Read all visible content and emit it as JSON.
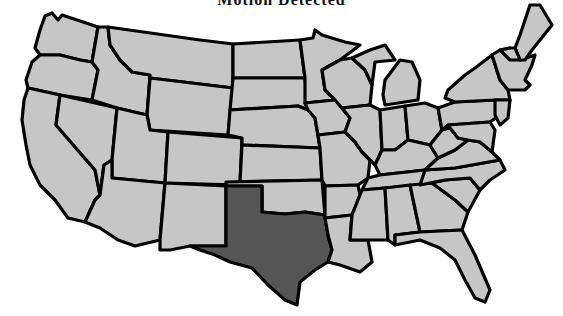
{
  "title": "Motion Detected",
  "map": {
    "fill_color": "#c6c6c6",
    "highlight_color": "#555555",
    "border_color": "#000000",
    "highlighted_state": "Texas",
    "states": [
      {
        "id": "WA",
        "points": "45,16 52,13 58,20 62,15 98,27 92,62 80,60 60,55 40,55 35,48 40,30"
      },
      {
        "id": "OR",
        "points": "40,55 60,55 80,60 92,62 98,70 92,100 60,95 28,88 26,80 32,62"
      },
      {
        "id": "CA",
        "points": "28,88 60,95 56,125 95,170 100,195 95,200 85,222 68,218 55,200 40,185 30,165 26,145 22,120 24,100"
      },
      {
        "id": "NV",
        "points": "60,95 117,108 112,160 104,165 100,195 95,170 56,125"
      },
      {
        "id": "ID",
        "points": "98,27 108,27 110,45 120,60 132,72 150,75 147,115 117,108 92,100 98,70 92,62"
      },
      {
        "id": "MT",
        "points": "108,27 200,40 233,44 233,88 150,78 150,75 132,72 120,60 110,45"
      },
      {
        "id": "WY",
        "points": "150,78 233,88 228,135 150,130 147,115"
      },
      {
        "id": "UT",
        "points": "117,108 147,115 150,130 168,132 165,183 112,178 112,160"
      },
      {
        "id": "AZ",
        "points": "112,178 165,183 160,240 135,246 118,240 100,228 85,222 95,200 100,195 104,165 112,160"
      },
      {
        "id": "CO",
        "points": "168,132 242,138 240,185 165,183"
      },
      {
        "id": "NM",
        "points": "165,183 226,186 226,246 190,246 170,250 160,250 160,240"
      },
      {
        "id": "ND",
        "points": "233,44 300,40 305,78 233,78"
      },
      {
        "id": "SD",
        "points": "233,78 305,78 308,110 298,106 230,110"
      },
      {
        "id": "NE",
        "points": "230,110 298,106 308,110 315,118 320,148 242,145 242,138 228,135"
      },
      {
        "id": "KS",
        "points": "242,145 320,148 322,180 240,182"
      },
      {
        "id": "OK",
        "points": "226,182 322,180 325,215 305,212 285,214 262,212 262,186 226,186"
      },
      {
        "id": "TX",
        "cls": "highlight",
        "points": "226,186 262,186 262,212 285,214 305,212 325,215 328,235 332,250 328,262 315,270 300,282 297,305 285,300 268,285 252,268 230,262 215,255 200,250 190,246 226,246"
      },
      {
        "id": "MN",
        "points": "300,40 313,38 315,30 322,35 345,42 360,45 340,60 322,70 325,90 335,100 305,103 305,78"
      },
      {
        "id": "IA",
        "points": "305,103 335,100 342,108 350,118 345,132 318,135 315,118 308,110"
      },
      {
        "id": "MO",
        "points": "318,135 345,132 355,142 362,152 370,160 368,178 358,185 325,186 322,180 320,148"
      },
      {
        "id": "AR",
        "points": "325,186 358,185 360,195 352,215 325,218 325,215"
      },
      {
        "id": "LA",
        "points": "325,218 352,215 350,240 368,240 372,262 360,272 340,265 328,262 332,250 328,235"
      },
      {
        "id": "WI",
        "points": "322,70 340,60 352,58 365,70 372,85 370,105 342,108 335,100 325,90"
      },
      {
        "id": "IL",
        "points": "342,108 370,105 380,110 382,150 375,165 370,160 362,152 355,142 345,132 350,118"
      },
      {
        "id": "MI",
        "points": "352,58 370,50 385,45 395,60 375,62 372,85 365,70"
      },
      {
        "id": "MIL",
        "points": "385,80 400,60 412,62 420,80 418,100 385,105 383,95"
      },
      {
        "id": "IN",
        "points": "380,110 405,106 408,140 395,150 382,150"
      },
      {
        "id": "OH",
        "points": "405,106 425,103 438,108 442,130 430,145 408,140"
      },
      {
        "id": "KY",
        "points": "375,165 382,150 395,150 408,140 430,145 438,158 425,170 380,175"
      },
      {
        "id": "TN",
        "points": "368,178 380,175 425,170 455,168 445,180 420,185 362,190"
      },
      {
        "id": "MS",
        "points": "362,190 385,188 388,240 368,240 350,240 352,215 360,195"
      },
      {
        "id": "AL",
        "points": "385,188 410,185 420,232 395,235 395,245 388,240"
      },
      {
        "id": "GA",
        "points": "410,185 432,183 455,200 468,212 462,230 420,232"
      },
      {
        "id": "FL",
        "points": "395,235 420,232 462,230 475,255 490,290 485,302 475,298 465,280 455,260 440,248 420,240 395,245"
      },
      {
        "id": "SC",
        "points": "432,183 445,180 470,178 480,190 468,212 455,200"
      },
      {
        "id": "NC",
        "points": "425,170 455,168 500,160 505,170 490,180 480,190 470,178 445,180 420,185"
      },
      {
        "id": "VA",
        "points": "438,158 455,150 468,140 480,142 492,152 500,160 455,168 425,170"
      },
      {
        "id": "WV",
        "points": "430,145 442,130 450,128 458,138 468,140 455,150 438,158"
      },
      {
        "id": "PA",
        "points": "438,108 455,102 495,100 500,115 490,122 448,125 442,130"
      },
      {
        "id": "NY",
        "points": "448,90 465,75 475,68 492,55 500,80 508,90 510,100 495,100 455,102 445,98"
      },
      {
        "id": "MDDE",
        "points": "448,125 490,122 495,130 492,152 480,142 468,140 458,138 450,128"
      },
      {
        "id": "NJ",
        "points": "495,100 510,100 508,118 500,125 495,115"
      },
      {
        "id": "NE-STATES",
        "points": "492,55 500,50 510,48 520,60 535,55 532,65 525,80 530,85 525,90 508,90 500,80"
      },
      {
        "id": "ME",
        "points": "520,35 530,5 540,5 552,25 540,40 532,50 525,60 520,60 515,48"
      },
      {
        "id": "VTNH",
        "points": "500,50 510,48 515,48 520,60 510,60"
      }
    ]
  }
}
